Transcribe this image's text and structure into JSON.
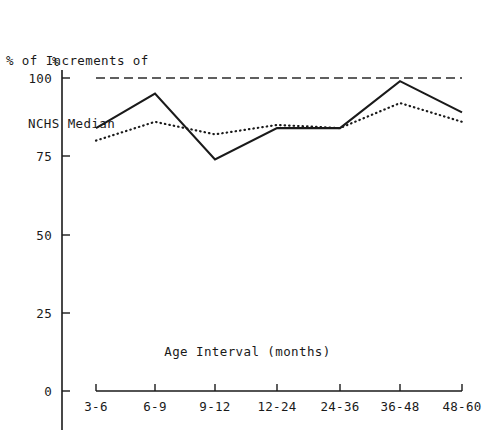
{
  "chart_data": {
    "type": "line",
    "title": "% of Increments of NCHS Median",
    "title_lines": [
      "% of Increments of",
      "NCHS Median"
    ],
    "xlabel": "Age Interval (months)",
    "ylabel": "%",
    "categories": [
      "3-6",
      "6-9",
      "9-12",
      "12-24",
      "24-36",
      "36-48",
      "48-60"
    ],
    "ylim": [
      0,
      100
    ],
    "yticks": [
      0,
      25,
      50,
      75,
      100
    ],
    "ytick_labels": [
      "0",
      "25",
      "50",
      "75",
      "100"
    ],
    "grid": false,
    "legend": "none",
    "series": [
      {
        "name": "Reference (NCHS median)",
        "style": "dashed",
        "values": [
          100,
          100,
          100,
          100,
          100,
          100,
          100
        ]
      },
      {
        "name": "Solid line group",
        "style": "solid",
        "values": [
          84,
          95,
          74,
          84,
          84,
          99,
          89
        ]
      },
      {
        "name": "Dotted line group",
        "style": "dotted",
        "values": [
          80,
          86,
          82,
          85,
          84,
          92,
          86
        ]
      }
    ]
  },
  "axes": {
    "y_unit_label": "%",
    "x_title": "Age Interval (months)"
  },
  "heading": {
    "line1": "% of Increments of",
    "line2": "NCHS Median"
  }
}
